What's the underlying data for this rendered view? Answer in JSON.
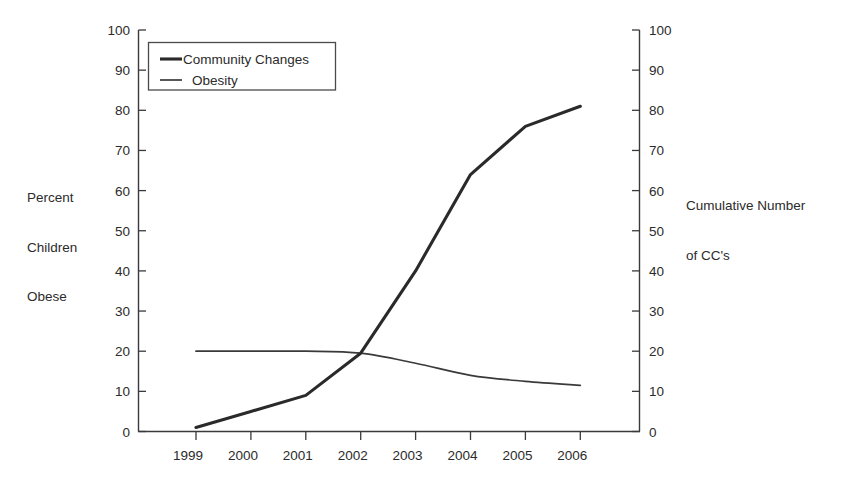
{
  "chart_data": {
    "type": "line",
    "title": "",
    "xlabel": "",
    "ylabel": "Percent Children Obese",
    "y2label": "Cumulative Number of CC's",
    "ylabel_lines": [
      "Percent",
      "Children",
      "Obese"
    ],
    "y2label_lines": [
      "Cumulative Number",
      "of CC's"
    ],
    "categories": [
      "1999",
      "2000",
      "2001",
      "2002",
      "2003",
      "2004",
      "2005",
      "2006"
    ],
    "x": [
      1999,
      2000,
      2001,
      2002,
      2003,
      2004,
      2005,
      2006
    ],
    "xtick_labels": [
      "1999",
      "2000",
      "2001",
      "2002",
      "2003",
      "2004",
      "2005",
      "2006"
    ],
    "ylim": [
      0,
      100
    ],
    "y2lim": [
      0,
      100
    ],
    "ytick_labels": [
      "0",
      "10",
      "20",
      "30",
      "40",
      "50",
      "60",
      "70",
      "80",
      "90",
      "100"
    ],
    "ytick_values": [
      0,
      10,
      20,
      30,
      40,
      50,
      60,
      70,
      80,
      90,
      100
    ],
    "y2tick_labels": [
      "0",
      "10",
      "20",
      "30",
      "40",
      "50",
      "60",
      "70",
      "80",
      "90",
      "100"
    ],
    "y2tick_values": [
      0,
      10,
      20,
      30,
      40,
      50,
      60,
      70,
      80,
      90,
      100
    ],
    "grid": false,
    "legend_position": "top-left",
    "series": [
      {
        "name": "Community Changes",
        "axis": "right",
        "style": "thick",
        "color": "#2a2a2a",
        "values": [
          1,
          5,
          9,
          19.5,
          40,
          64,
          76,
          81
        ]
      },
      {
        "name": "Obesity",
        "axis": "left",
        "style": "thin",
        "color": "#3a3a3a",
        "values": [
          20,
          20,
          20,
          19.5,
          17,
          14,
          12.5,
          11.5
        ]
      }
    ]
  },
  "legend": {
    "items": [
      {
        "label": "Community Changes",
        "style": "thick"
      },
      {
        "label": "Obesity",
        "style": "thin"
      }
    ]
  }
}
